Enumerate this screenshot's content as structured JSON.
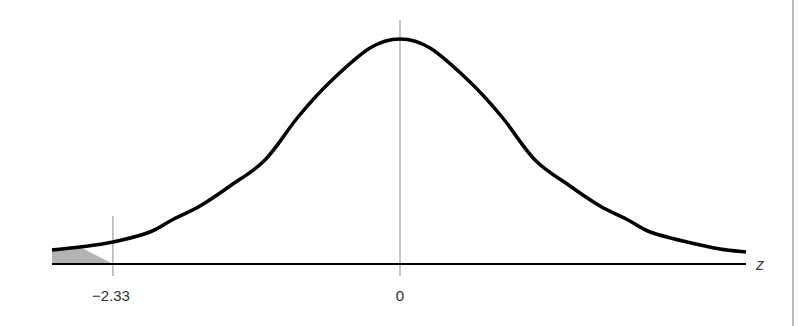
{
  "chart_data": {
    "type": "area",
    "title": "",
    "subtitle": "Standard normal distribution with left-tail critical region",
    "xlabel": "z",
    "ylabel": "",
    "distribution": "standard normal",
    "tick_labels": [
      "−2.33",
      "0"
    ],
    "ticks": [
      {
        "value": -2.33,
        "label": "−2.33"
      },
      {
        "value": 0,
        "label": "0"
      }
    ],
    "shaded_region": {
      "from": "-inf",
      "to": -2.33,
      "tail": "left",
      "color": "#b3b3b3"
    },
    "xlim": [
      -2.82,
      2.81
    ],
    "grid": false,
    "legend": null,
    "curve_color": "#000000",
    "axis_color": "#000000",
    "reference_line_color": "#888888"
  },
  "layout": {
    "axis_y": 264,
    "axis_x_start": 52,
    "axis_x_end": 746,
    "center_x": 400,
    "scale_px_per_z": 123.2,
    "center_line_top": 20,
    "crit_line_top": 216,
    "crit_line_bottom": 276,
    "curve_points": [
      [
        52,
        250
      ],
      [
        80,
        247
      ],
      [
        113,
        242
      ],
      [
        150,
        232
      ],
      [
        172,
        220
      ],
      [
        200,
        206
      ],
      [
        230,
        186
      ],
      [
        265,
        160
      ],
      [
        298,
        117
      ],
      [
        330,
        82
      ],
      [
        370,
        48
      ],
      [
        400,
        39
      ],
      [
        430,
        48
      ],
      [
        470,
        82
      ],
      [
        502,
        117
      ],
      [
        535,
        160
      ],
      [
        570,
        186
      ],
      [
        600,
        206
      ],
      [
        628,
        220
      ],
      [
        650,
        232
      ],
      [
        687,
        242
      ],
      [
        720,
        249
      ],
      [
        746,
        252
      ]
    ]
  },
  "labels": {
    "crit_value": "−2.33",
    "center_value": "0",
    "axis_variable": "z"
  }
}
